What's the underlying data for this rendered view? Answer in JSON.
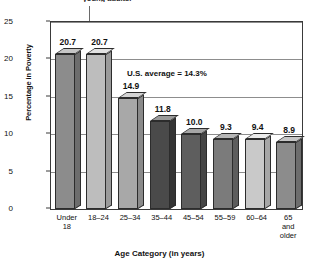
{
  "caption": {
    "text": "young adults.",
    "arrow": "down-arrow-to-bar"
  },
  "chart_data": {
    "type": "bar",
    "title": "",
    "xlabel": "Age Category (in years)",
    "ylabel": "Percentage in Poverty",
    "categories": [
      "Under 18",
      "18–24",
      "25–34",
      "35–44",
      "45–54",
      "55–59",
      "60–64",
      "65 and older"
    ],
    "category_lines": [
      [
        "Under",
        "18"
      ],
      [
        "18–24"
      ],
      [
        "25–34"
      ],
      [
        "35–44"
      ],
      [
        "45–54"
      ],
      [
        "55–59"
      ],
      [
        "60–64"
      ],
      [
        "65",
        "and",
        "older"
      ]
    ],
    "values": [
      20.7,
      20.7,
      14.9,
      11.8,
      10.0,
      9.3,
      9.4,
      8.9
    ],
    "value_labels": [
      "20.7",
      "20.7",
      "14.9",
      "11.8",
      "10.0",
      "9.3",
      "9.4",
      "8.9"
    ],
    "bar_colors": [
      "#8c8c8c",
      "#bdbdbd",
      "#a8a8a8",
      "#4a4a4a",
      "#5e5e5e",
      "#7b7b7b",
      "#c9c9c9",
      "#8c8c8c"
    ],
    "bar_top_colors": [
      "#c6c6c6",
      "#e2e2e2",
      "#d4d4d4",
      "#9a9a9a",
      "#a6a6a6",
      "#b6b6b6",
      "#ebebeb",
      "#c6c6c6"
    ],
    "bar_side_colors": [
      "#6d6d6d",
      "#9a9a9a",
      "#8a8a8a",
      "#343434",
      "#454545",
      "#5d5d5d",
      "#a6a6a6",
      "#6d6d6d"
    ],
    "ylim": [
      0,
      25
    ],
    "yticks": [
      0,
      5,
      10,
      15,
      20,
      25
    ],
    "ytick_labels": [
      "0",
      "5",
      "15",
      "15",
      "20",
      "25"
    ],
    "ytick_labels_display": [
      "25",
      "20",
      "15",
      "10",
      "5",
      "0"
    ],
    "grid": true,
    "legend": "none",
    "annotations": [
      {
        "text": "U.S. average = 14.3%",
        "value": 14.3
      }
    ]
  }
}
